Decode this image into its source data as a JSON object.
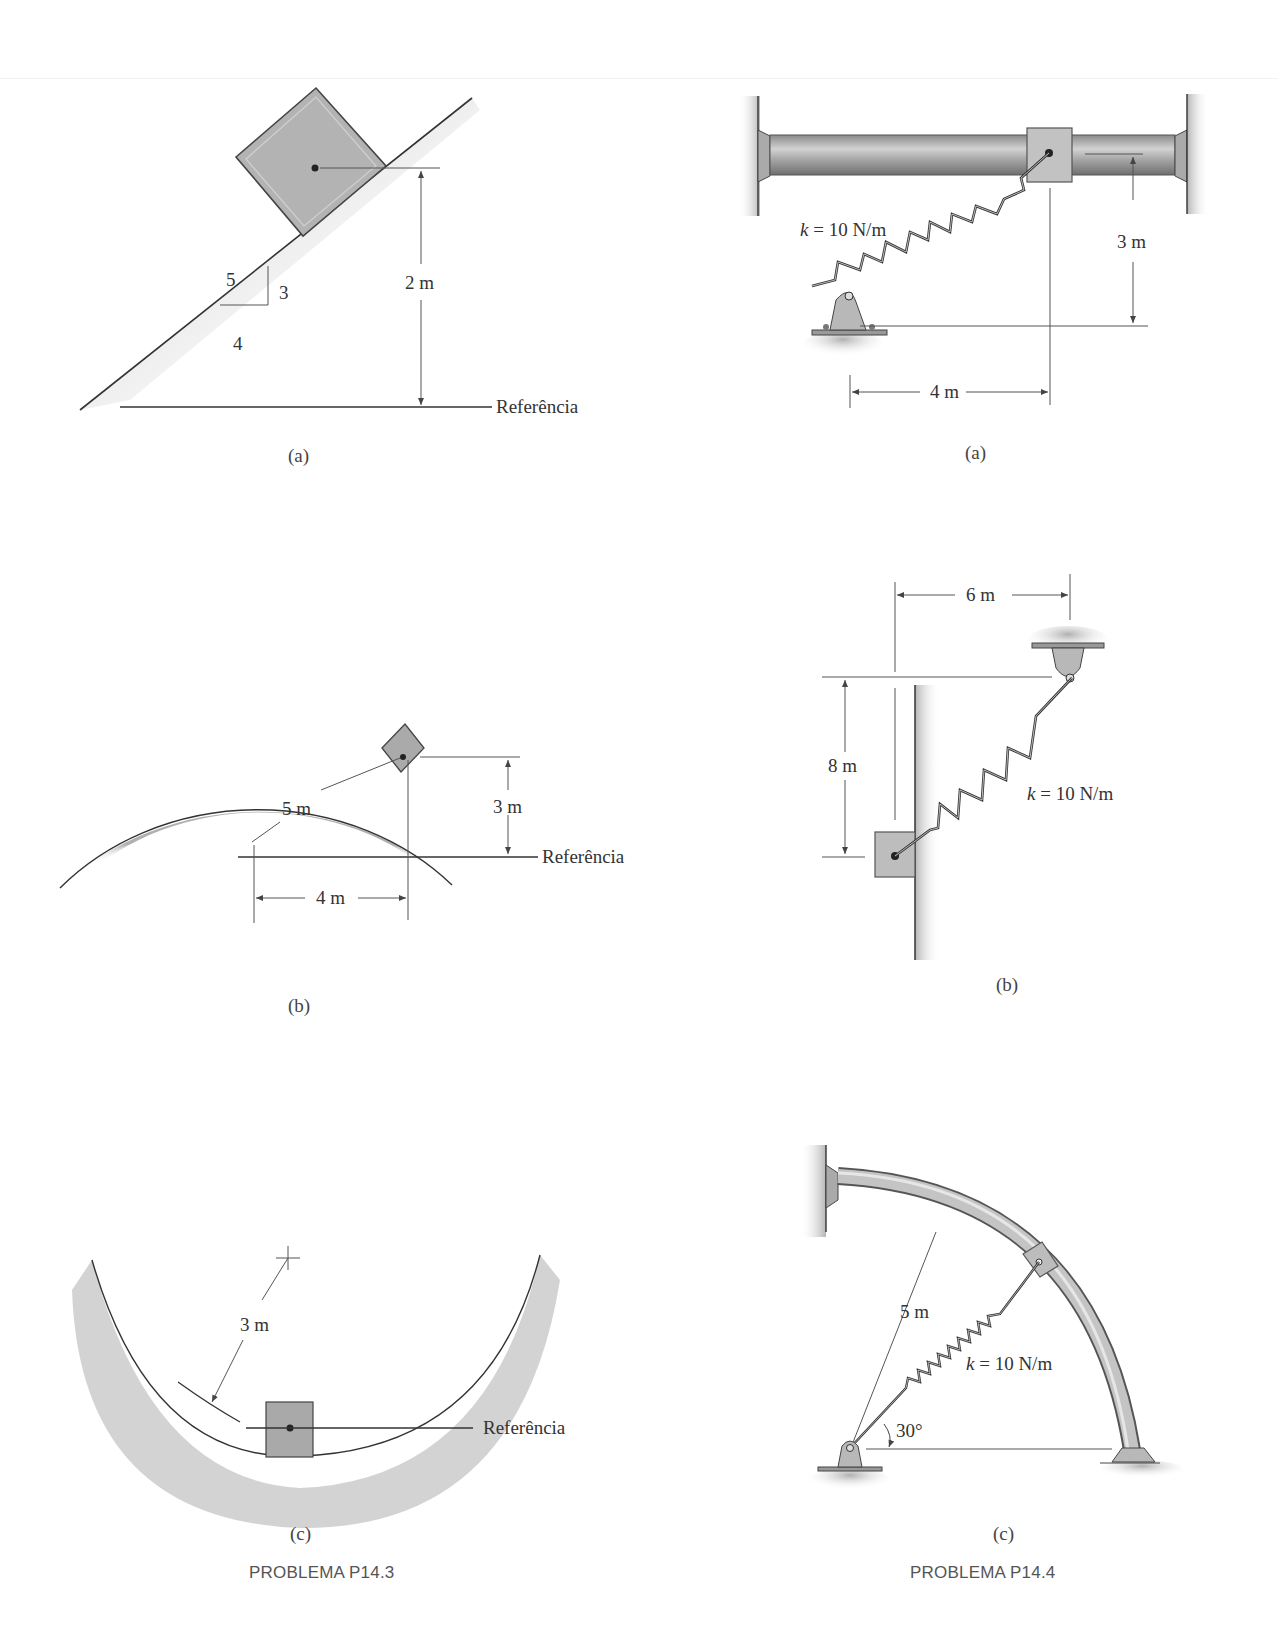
{
  "page": {
    "left_problem": {
      "title": "PROBLEMA P14.3",
      "figures": {
        "a": {
          "caption": "(a)",
          "slope_hyp": "5",
          "slope_rise": "3",
          "slope_run": "4",
          "height_label": "2 m",
          "datum_label": "Referência"
        },
        "b": {
          "caption": "(b)",
          "radius_label": "5 m",
          "height_label": "3 m",
          "horizontal_label": "4 m",
          "datum_label": "Referência"
        },
        "c": {
          "caption": "(c)",
          "radius_label": "3 m",
          "datum_label": "Referência"
        }
      }
    },
    "right_problem": {
      "title": "PROBLEMA P14.4",
      "figures": {
        "a": {
          "caption": "(a)",
          "spring_label": "k = 10 N/m",
          "spring_k": "k",
          "spring_value": " = 10 N/m",
          "vertical_label": "3 m",
          "horizontal_label": "4 m"
        },
        "b": {
          "caption": "(b)",
          "spring_k": "k",
          "spring_value": " = 10 N/m",
          "horizontal_label": "6 m",
          "vertical_label": "8 m"
        },
        "c": {
          "caption": "(c)",
          "spring_k": "k",
          "spring_value": " = 10 N/m",
          "radius_label": "5 m",
          "angle_label": "30°"
        }
      }
    }
  },
  "colors": {
    "fill_gray": "#b4b4b4",
    "line": "#3a3a3a",
    "shade": "#c8c8c8"
  }
}
